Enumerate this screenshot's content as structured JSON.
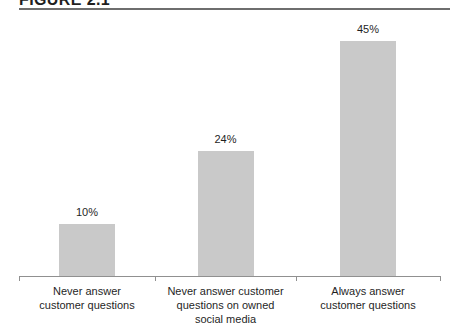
{
  "figure": {
    "title": "FIGURE 2.1"
  },
  "chart_data": {
    "type": "bar",
    "title": "FIGURE 2.1",
    "categories": [
      "Never answer customer questions",
      "Never answer customer questions on owned social media",
      "Always answer customer questions"
    ],
    "category_lines": [
      [
        "Never answer",
        "customer questions"
      ],
      [
        "Never answer customer",
        "questions on owned",
        "social media"
      ],
      [
        "Always answer",
        "customer questions"
      ]
    ],
    "values": [
      10,
      24,
      45
    ],
    "value_labels": [
      "10%",
      "24%",
      "45%"
    ],
    "xlabel": "",
    "ylabel": "",
    "ylim": [
      0,
      50
    ],
    "grid": false,
    "legend": false,
    "bar_color": "#c9c9c9",
    "axis_color": "#909090",
    "rule_color": "#6e6e6e",
    "text_color": "#1f1f1f",
    "background_color": "#ffffff"
  }
}
